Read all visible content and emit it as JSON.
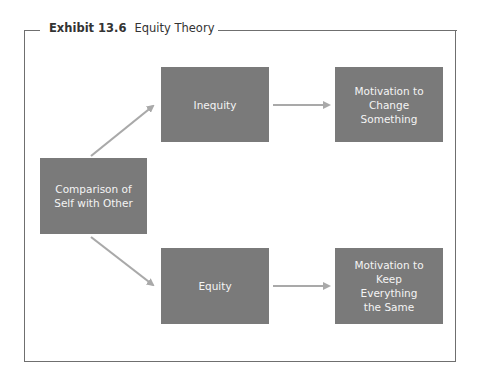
{
  "exhibit": {
    "number": "Exhibit 13.6",
    "title": "Equity Theory"
  },
  "diagram": {
    "nodes": {
      "comparison": "Comparison of Self with Other",
      "inequity": "Inequity",
      "equity": "Equity",
      "motivation_change": "Motivation to Change Something",
      "motivation_keep": "Motivation to Keep Everything the Same"
    },
    "edges": [
      {
        "from": "comparison",
        "to": "inequity"
      },
      {
        "from": "comparison",
        "to": "equity"
      },
      {
        "from": "inequity",
        "to": "motivation_change"
      },
      {
        "from": "equity",
        "to": "motivation_keep"
      }
    ],
    "colors": {
      "box": "#7a7a7a",
      "box_text": "#f4f4f4",
      "arrow": "#a9a9a9",
      "frame": "#6f6f6f"
    }
  }
}
